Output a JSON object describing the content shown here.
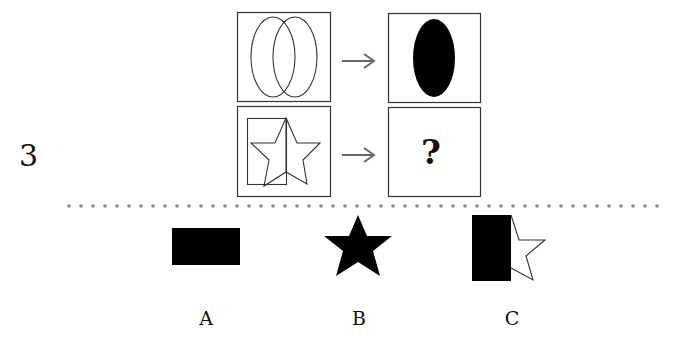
{
  "question": {
    "number": "3",
    "analogy": {
      "example_input": "two-overlapping-ellipses",
      "example_output": "filled-ellipse",
      "query_input": "rectangle-overlapping-star",
      "query_output": "?"
    },
    "arrow_symbol": "→"
  },
  "options": [
    {
      "label": "A",
      "shape": "filled-rectangle"
    },
    {
      "label": "B",
      "shape": "filled-star"
    },
    {
      "label": "C",
      "shape": "filled-rectangle-with-half-star"
    }
  ],
  "colors": {
    "stroke": "#333333",
    "fill": "#000000",
    "arrow": "#666666",
    "dots": "#888888"
  }
}
